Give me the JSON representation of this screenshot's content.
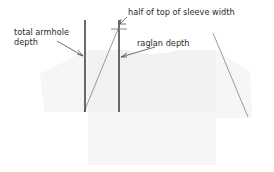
{
  "diagram": {
    "canvas": {
      "width": 274,
      "height": 172
    },
    "background_color": "#ffffff",
    "garment_color": "#f2f2f2",
    "measure_line_color": "#3a3a3a",
    "seam_line_color": "#9a9a9a",
    "leader_line_color": "#4a4a4a",
    "text_color": "#2b2b2b"
  },
  "labels": {
    "total_armhole_depth_line1": "total armhole",
    "total_armhole_depth_line2": "depth",
    "half_top_sleeve_width": "half of top of sleeve width",
    "raglan_depth": "raglan depth"
  },
  "measurements": [
    {
      "name": "total armhole depth",
      "line_x": 85,
      "line_y_top": 20,
      "line_y_bottom": 112,
      "length_px": 92
    },
    {
      "name": "raglan depth",
      "line_x": 119,
      "line_y_top": 20,
      "line_y_bottom": 112,
      "length_px": 92
    },
    {
      "name": "half of top of sleeve width",
      "tick_x": 119,
      "tick_y": 29,
      "tick_half_width": 8
    }
  ],
  "seams": [
    {
      "name": "left raglan seam",
      "x1": 118,
      "y1": 29,
      "x2": 84,
      "y2": 112
    },
    {
      "name": "right raglan seam",
      "x1": 213,
      "y1": 33,
      "x2": 248,
      "y2": 117
    }
  ]
}
